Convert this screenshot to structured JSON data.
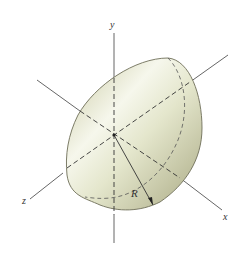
{
  "figure": {
    "type": "hemisphere-diagram",
    "axes": {
      "x_label": "x",
      "y_label": "y",
      "z_label": "z"
    },
    "dimension_label": "R",
    "colors": {
      "fill_light": "#f4f5e6",
      "fill_dark": "#b8b88e",
      "outline": "#6e6e58",
      "axis": "#555555",
      "dash": "#333333"
    }
  }
}
